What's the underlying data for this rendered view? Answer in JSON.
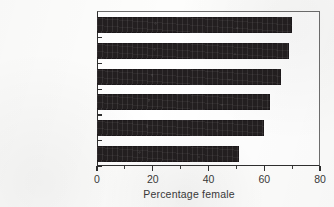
{
  "chart_data": {
    "type": "bar",
    "orientation": "horizontal",
    "title": "",
    "subtitle": "",
    "xlabel": "Percentage female",
    "ylabel": "",
    "categories": [
      "Germany, Fed. R",
      "USA",
      "China",
      "Japan",
      "Greece",
      "India"
    ],
    "values": [
      70,
      69,
      66,
      62,
      60,
      51
    ],
    "series": [
      {
        "name": "Percentage female",
        "values": [
          70,
          69,
          66,
          62,
          60,
          51
        ]
      }
    ],
    "xlim": [
      0,
      80
    ],
    "xticks": [
      0,
      20,
      40,
      60,
      80
    ],
    "xtick_labels": [
      "0",
      "20",
      "40",
      "60",
      "80"
    ],
    "minor_xticks": [
      10,
      30,
      50,
      70
    ],
    "grid": false,
    "legend": false,
    "legend_position": "none",
    "bar_color": "#231f20",
    "background_color": "#ffffff",
    "axis_color": "#2f2f2f",
    "text_color": "#3a3a3a"
  },
  "figure": {
    "axis_title": "Percentage female"
  }
}
